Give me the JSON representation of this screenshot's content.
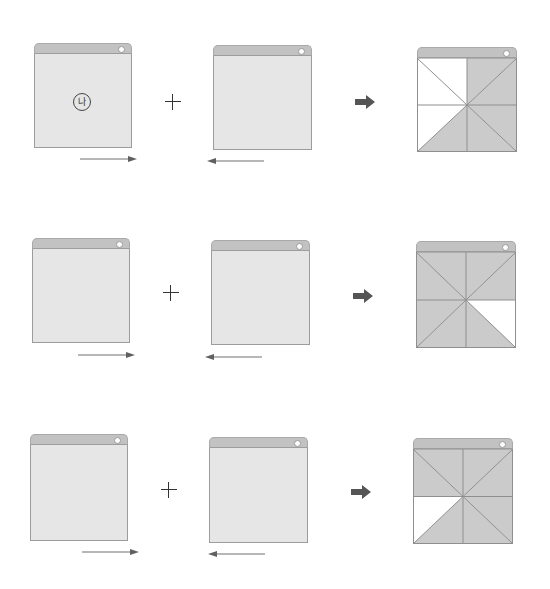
{
  "colors": {
    "title_bar": "#c2c2c2",
    "panel_body": "#e6e6e6",
    "filled_triangle": "#cbcbcb",
    "white_triangle": "#ffffff",
    "line": "#8f8f8f",
    "block_arrow": "#555555",
    "thin_arrow": "#707070"
  },
  "rows": [
    {
      "left_panel": {
        "symbol": "나",
        "arrow_direction": "right"
      },
      "operator": "+",
      "right_panel": {
        "symbol": "",
        "arrow_direction": "left"
      },
      "result_arrow": "block-right",
      "result_panel": {
        "white_triangles": [
          "TL-top",
          "TL-left",
          "BL-left"
        ]
      }
    },
    {
      "left_panel": {
        "symbol": "",
        "arrow_direction": "right"
      },
      "operator": "+",
      "right_panel": {
        "symbol": "",
        "arrow_direction": "left"
      },
      "result_arrow": "block-right",
      "result_panel": {
        "white_triangles": [
          "BR-right"
        ]
      }
    },
    {
      "left_panel": {
        "symbol": "",
        "arrow_direction": "right"
      },
      "operator": "+",
      "right_panel": {
        "symbol": "",
        "arrow_direction": "left"
      },
      "result_arrow": "block-right",
      "result_panel": {
        "white_triangles": [
          "BL-left"
        ]
      }
    }
  ]
}
